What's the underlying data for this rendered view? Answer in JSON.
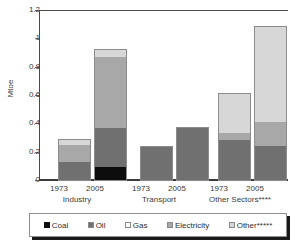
{
  "chart_data": {
    "type": "bar",
    "subtype": "stacked",
    "title": "",
    "xlabel": "",
    "ylabel": "Mtoe",
    "ylim": [
      0,
      1.2
    ],
    "yticks": [
      "0",
      "0.2",
      "0.4",
      "0.6",
      "0.8",
      "1",
      "1.2"
    ],
    "ytick_values": [
      0,
      0.2,
      0.4,
      0.6,
      0.8,
      1,
      1.2
    ],
    "grid": true,
    "legend_position": "bottom",
    "groups": [
      "Industry",
      "Transport",
      "Other Sectors****"
    ],
    "categories": [
      "1973",
      "2005",
      "1973",
      "2005",
      "1973",
      "2005"
    ],
    "series": [
      {
        "name": "Coal",
        "color": "#0d0d0d",
        "values": [
          0.0,
          0.095,
          0.0,
          0.0,
          0.0,
          0.0
        ]
      },
      {
        "name": "Oil",
        "color": "#707070",
        "values": [
          0.125,
          0.275,
          0.235,
          0.365,
          0.285,
          0.24
        ]
      },
      {
        "name": "Gas",
        "color": "#ffffff",
        "values": [
          0.0,
          0.0,
          0.0,
          0.0,
          0.0,
          0.0
        ]
      },
      {
        "name": "Electricity",
        "color": "#a8a8a8",
        "values": [
          0.125,
          0.5,
          0.0,
          0.0,
          0.045,
          0.17
        ]
      },
      {
        "name": "Other*****",
        "color": "#d7d7d7",
        "values": [
          0.03,
          0.05,
          0.0,
          0.0,
          0.28,
          0.67
        ]
      }
    ],
    "totals": [
      0.28,
      0.92,
      0.235,
      0.365,
      0.61,
      1.08
    ]
  },
  "axis": {
    "y_title": "Mtoe",
    "ticks": [
      {
        "label": "1.2",
        "value": 1.2
      },
      {
        "label": "1",
        "value": 1.0
      },
      {
        "label": "0.8",
        "value": 0.8
      },
      {
        "label": "0.6",
        "value": 0.6
      },
      {
        "label": "0.4",
        "value": 0.4
      },
      {
        "label": "0.2",
        "value": 0.2
      },
      {
        "label": "0",
        "value": 0.0
      }
    ]
  },
  "xaxis": {
    "years": [
      "1973",
      "2005",
      "1973",
      "2005",
      "1973",
      "2005"
    ],
    "groups": [
      {
        "label": "Industry"
      },
      {
        "label": "Transport"
      },
      {
        "label": "Other Sectors****"
      }
    ]
  },
  "legend": {
    "items": [
      {
        "label": "Coal",
        "swatch": "coal-swatch"
      },
      {
        "label": "Oil",
        "swatch": "oil-swatch"
      },
      {
        "label": "Gas",
        "swatch": "gas-swatch"
      },
      {
        "label": "Electricity",
        "swatch": "electricity-swatch"
      },
      {
        "label": "Other*****",
        "swatch": "other-swatch"
      }
    ]
  }
}
